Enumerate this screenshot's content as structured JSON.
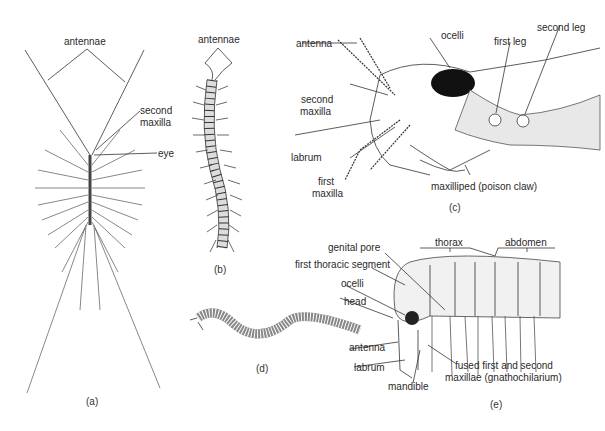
{
  "figure": {
    "panels": [
      {
        "id": "a",
        "caption": "(a)",
        "subject": "house centipede (dorsal view)",
        "labels": {
          "antennae": "antennae",
          "second_maxilla": "second\nmaxilla",
          "eye": "eye"
        }
      },
      {
        "id": "b",
        "caption": "(b)",
        "subject": "centipede (dorsal view)",
        "labels": {
          "antennae": "antennae"
        }
      },
      {
        "id": "c",
        "caption": "(c)",
        "subject": "centipede head (lateral view)",
        "labels": {
          "ocelli": "ocelli",
          "first_leg": "first leg",
          "second_leg": "second leg",
          "antenna": "antenna",
          "second_maxilla": "second\nmaxilla",
          "labrum": "labrum",
          "first_maxilla": "first\nmaxilla",
          "maxilliped": "maxilliped (poison claw)"
        }
      },
      {
        "id": "d",
        "caption": "(d)",
        "subject": "millipede"
      },
      {
        "id": "e",
        "caption": "(e)",
        "subject": "millipede anterior (lateral view)",
        "labels": {
          "genital_pore": "genital pore",
          "thorax": "thorax",
          "abdomen": "abdomen",
          "first_thoracic_segment": "first thoracic segment",
          "ocelli": "ocelli",
          "head": "head",
          "antenna": "antenna",
          "labrum": "labrum",
          "mandible": "mandible",
          "gnathochilarium_1": "fused first and second",
          "gnathochilarium_2": "maxillae (gnathochilarium)"
        }
      }
    ]
  },
  "a": {
    "antennae": "antennae",
    "second": "second",
    "maxilla": "maxilla",
    "eye": "eye",
    "cap": "(a)"
  },
  "b": {
    "antennae": "antennae",
    "cap": "(b)"
  },
  "c": {
    "ocelli": "ocelli",
    "first_leg": "first leg",
    "second_leg": "second leg",
    "antenna": "antenna",
    "second": "second",
    "maxilla": "maxilla",
    "labrum": "labrum",
    "first": "first",
    "maxilla2": "maxilla",
    "maxilliped": "maxilliped (poison claw)",
    "cap": "(c)"
  },
  "d": {
    "cap": "(d)"
  },
  "e": {
    "genital_pore": "genital pore",
    "thorax": "thorax",
    "abdomen": "abdomen",
    "first_thoracic": "first thoracic segment",
    "ocelli": "ocelli",
    "head": "head",
    "antenna": "antenna",
    "labrum": "labrum",
    "mandible": "mandible",
    "fused1": "fused first and second",
    "fused2": "maxillae (gnathochilarium)",
    "cap": "(e)"
  }
}
